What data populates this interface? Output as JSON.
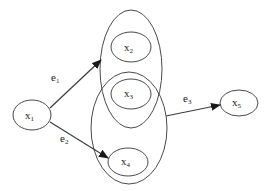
{
  "diagram": {
    "type": "hypergraph",
    "nodes": [
      {
        "id": "x1",
        "label": "x",
        "sub": "1"
      },
      {
        "id": "x2",
        "label": "x",
        "sub": "2"
      },
      {
        "id": "x3",
        "label": "x",
        "sub": "3"
      },
      {
        "id": "x4",
        "label": "x",
        "sub": "4"
      },
      {
        "id": "x5",
        "label": "x",
        "sub": "5"
      }
    ],
    "groups": [
      {
        "id": "group-upper",
        "members": [
          "x2",
          "x3"
        ]
      },
      {
        "id": "group-lower",
        "members": [
          "x3",
          "x4"
        ]
      }
    ],
    "edges": [
      {
        "id": "e1",
        "label": "e",
        "sub": "1",
        "from": "x1",
        "to": "group-upper"
      },
      {
        "id": "e2",
        "label": "e",
        "sub": "2",
        "from": "x1",
        "to": "x4"
      },
      {
        "id": "e3",
        "label": "e",
        "sub": "3",
        "from": "group-lower",
        "to": "x5"
      }
    ],
    "colors": {
      "stroke": "#4a4a4a",
      "background": "#ffffff"
    }
  }
}
